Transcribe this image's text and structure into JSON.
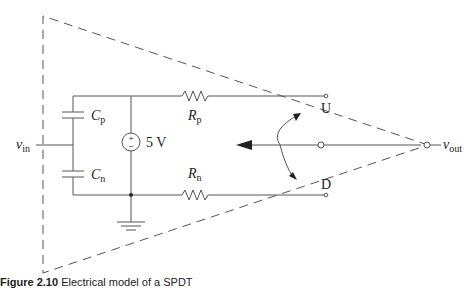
{
  "figure": {
    "caption_number": "Figure 2.10",
    "caption_text": "Electrical model of a SPDT",
    "labels": {
      "v_in": "v",
      "v_in_sub": "in",
      "v_out": "v",
      "v_out_sub": "out",
      "cp": "C",
      "cp_sub": "p",
      "cn": "C",
      "cn_sub": "n",
      "rp": "R",
      "rp_sub": "p",
      "rn": "R",
      "rn_sub": "n",
      "source": "5 V",
      "source_plus": "+",
      "source_minus": "−",
      "terminal_up": "U",
      "terminal_down": "D"
    },
    "components": [
      {
        "id": "Cp",
        "type": "capacitor"
      },
      {
        "id": "Cn",
        "type": "capacitor"
      },
      {
        "id": "Rp",
        "type": "resistor"
      },
      {
        "id": "Rn",
        "type": "resistor"
      },
      {
        "id": "V1",
        "type": "dc-voltage-source",
        "value": "5 V"
      },
      {
        "id": "GND",
        "type": "ground"
      },
      {
        "id": "SW",
        "type": "spdt-switch",
        "throws": [
          "U",
          "D"
        ]
      }
    ],
    "colors": {
      "line": "#555555",
      "text": "#222222",
      "background": "#ffffff"
    }
  }
}
